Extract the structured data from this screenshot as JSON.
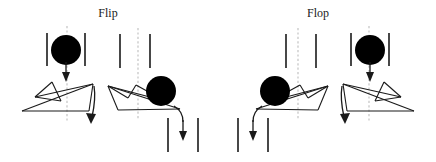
{
  "figure": {
    "background_color": "#ffffff",
    "width": 436,
    "height": 162,
    "ink_color": "#1a1a1a",
    "ball_color": "#000000",
    "axis_color": "#bdbdbd"
  },
  "panels": [
    {
      "group": "flip",
      "title": "Flip",
      "stage": "before",
      "ball_side": "center-top",
      "arrow_in": "down",
      "arrow_out": "curve-right-down"
    },
    {
      "group": "flip",
      "title": "Flip",
      "stage": "after",
      "ball_side": "right",
      "arrow_in": "none",
      "arrow_out": "down-right"
    },
    {
      "group": "flop",
      "title": "Flop",
      "stage": "before",
      "ball_side": "center-top",
      "arrow_in": "down",
      "arrow_out": "curve-left-down"
    },
    {
      "group": "flop",
      "title": "Flop",
      "stage": "after",
      "ball_side": "left",
      "arrow_in": "none",
      "arrow_out": "down-left"
    }
  ],
  "labels": {
    "flip": "Flip",
    "flop": "Flop"
  },
  "icons": {
    "ball": "black-ball-icon",
    "wall": "vertical-wall-bar-icon",
    "axis": "dashed-center-axis-icon",
    "arrow_down": "down-arrow-icon",
    "arrow_curve": "curved-arrow-icon",
    "paper": "folded-paper-icon"
  }
}
